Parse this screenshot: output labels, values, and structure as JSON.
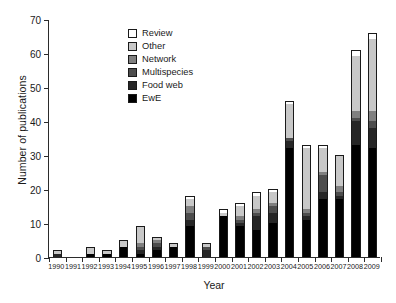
{
  "chart_data": {
    "type": "bar",
    "stacked": true,
    "title": "",
    "xlabel": "Year",
    "ylabel": "Number of publications",
    "categories": [
      "1990",
      "1991",
      "1992",
      "1993",
      "1994",
      "1995",
      "1996",
      "1997",
      "1998",
      "1999",
      "2000",
      "2001",
      "2002",
      "2003",
      "2004",
      "2005",
      "2006",
      "2007",
      "2008",
      "2009"
    ],
    "ylim": [
      0,
      70
    ],
    "yticks": [
      0,
      10,
      20,
      30,
      40,
      50,
      60,
      70
    ],
    "grid": false,
    "legend_position": "upper-left-inside",
    "series": [
      {
        "name": "EwE",
        "color": "#000000",
        "values": [
          0,
          0,
          1,
          1,
          3,
          1,
          2,
          3,
          9,
          0,
          12,
          9,
          8,
          10,
          32,
          11,
          17,
          17,
          33,
          32
        ]
      },
      {
        "name": "Food web",
        "color": "#262626",
        "values": [
          1,
          0,
          0,
          0,
          0,
          1,
          1,
          0,
          2,
          2,
          0,
          1,
          4,
          3,
          2,
          1,
          2,
          1,
          7,
          6
        ]
      },
      {
        "name": "Multispecies",
        "color": "#4d4d4d",
        "values": [
          0,
          0,
          0,
          0,
          0,
          1,
          1,
          0,
          2,
          1,
          0,
          1,
          1,
          2,
          1,
          1,
          5,
          1,
          1,
          2
        ]
      },
      {
        "name": "Network",
        "color": "#808080",
        "values": [
          0,
          0,
          0,
          0,
          0,
          1,
          1,
          0,
          2,
          0,
          0,
          1,
          1,
          1,
          0,
          1,
          1,
          2,
          2,
          3
        ]
      },
      {
        "name": "Other",
        "color": "#c8c8c8",
        "values": [
          1,
          0,
          2,
          1,
          2,
          5,
          1,
          1,
          2,
          1,
          1,
          3,
          4,
          3,
          10,
          18,
          7,
          9,
          16,
          21
        ]
      },
      {
        "name": "Review",
        "color": "#ffffff",
        "values": [
          0,
          0,
          0,
          0,
          0,
          0,
          0,
          0,
          1,
          0,
          1,
          1,
          1,
          1,
          1,
          1,
          1,
          0,
          2,
          2
        ]
      }
    ],
    "totals": [
      2,
      0,
      3,
      2,
      5,
      9,
      6,
      4,
      18,
      4,
      14,
      16,
      19,
      20,
      46,
      33,
      33,
      30,
      61,
      66
    ]
  },
  "legend": {
    "items": [
      {
        "label": "Review",
        "color": "#ffffff"
      },
      {
        "label": "Other",
        "color": "#c8c8c8"
      },
      {
        "label": "Network",
        "color": "#808080"
      },
      {
        "label": "Multispecies",
        "color": "#4d4d4d"
      },
      {
        "label": "Food web",
        "color": "#262626"
      },
      {
        "label": "EwE",
        "color": "#000000"
      }
    ]
  },
  "axes": {
    "y_title": "Number of publications",
    "x_title": "Year",
    "y_tick_labels": [
      "0",
      "10",
      "20",
      "30",
      "40",
      "50",
      "60",
      "70"
    ],
    "x_tick_labels": [
      "1990",
      "1991",
      "1992",
      "1993",
      "1994",
      "1995",
      "1996",
      "1997",
      "1998",
      "1999",
      "2000",
      "2001",
      "2002",
      "2003",
      "2004",
      "2005",
      "2006",
      "2007",
      "2008",
      "2009"
    ]
  },
  "colors": {
    "axis": "#2b2b2b",
    "text": "#1a1a1a",
    "background": "#ffffff"
  }
}
